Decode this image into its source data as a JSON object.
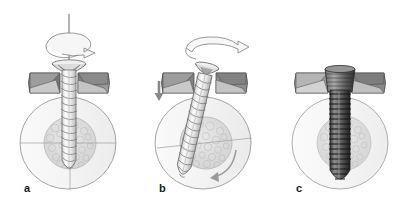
{
  "figure": {
    "background_color": "#ffffff",
    "width": 408,
    "height": 220
  },
  "palette": {
    "outline": "#5a5a5a",
    "outline_dark": "#3c3c3c",
    "bone_fill": "#f2f2f2",
    "bone_fill_light": "#f7f7f7",
    "cancellous_fill": "#dcdcdc",
    "cancellous_stipple": "#b4b4b4",
    "plate_dark": "#8c8c8c",
    "plate_light": "#d2d2d2",
    "screw_light": "#ededed",
    "screw_mid": "#c9c9c9",
    "screw_dark": "#4f4f4f",
    "screw_darker": "#2e2e2e",
    "arrow_fill": "#f4f4f4",
    "arrow_stroke": "#8a8a8a",
    "arrow_solid": "#8a8a8a",
    "label_color": "#1a1a1a"
  },
  "panels": [
    {
      "id": "a",
      "label": "a",
      "label_x": 24,
      "label_y": 189,
      "caption_semantic": "screw aligned above plate hole, rotating, not yet inserted",
      "elements": {
        "bone_circle": true,
        "crosshair": true,
        "cancellous_core": true,
        "plate": true,
        "screw_orientation": "vertical",
        "screw_state": "above-hole",
        "rotation_arrow": "helical-spiral",
        "axis_line": true,
        "down_arrow": false,
        "circular_arrow": false
      }
    },
    {
      "id": "b",
      "label": "b",
      "label_x": 159,
      "label_y": 189,
      "caption_semantic": "screw driven in at an angle with downward force and rotation",
      "elements": {
        "bone_circle": true,
        "crosshair": true,
        "cancellous_core": true,
        "plate": true,
        "screw_orientation": "tilted",
        "screw_state": "partially-inserted",
        "rotation_arrow": "curved-3d",
        "axis_line": false,
        "down_arrow": true,
        "circular_arrow": true
      }
    },
    {
      "id": "c",
      "label": "c",
      "label_x": 296,
      "label_y": 189,
      "caption_semantic": "screw fully seated in plate and bone",
      "elements": {
        "bone_circle": true,
        "crosshair": false,
        "cancellous_core": true,
        "plate": true,
        "screw_orientation": "vertical",
        "screw_state": "fully-seated",
        "rotation_arrow": "none",
        "axis_line": false,
        "down_arrow": false,
        "circular_arrow": false
      }
    }
  ]
}
